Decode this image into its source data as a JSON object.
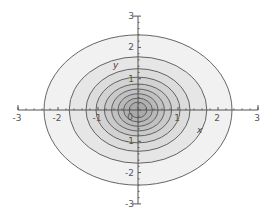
{
  "chart_data": {
    "type": "contour",
    "title": "",
    "xlabel": "x",
    "ylabel": "y",
    "xlim": [
      -3,
      3
    ],
    "ylim": [
      -3,
      3
    ],
    "x_ticks": [
      "-3",
      "-2",
      "-1",
      "0",
      "1",
      "2",
      "3"
    ],
    "y_ticks": [
      "3",
      "2",
      "1",
      "0",
      "-1",
      "-2",
      "-3"
    ],
    "grid": false,
    "legend": null,
    "center": [
      0,
      0
    ],
    "levels": [
      {
        "rx": 2.35,
        "ry": 2.4,
        "fill": "#f1f1f1"
      },
      {
        "rx": 1.72,
        "ry": 1.7,
        "fill": "#e6e6e6"
      },
      {
        "rx": 1.3,
        "ry": 1.32,
        "fill": "#dcdcdc"
      },
      {
        "rx": 1.05,
        "ry": 1.05,
        "fill": "#d2d2d2"
      },
      {
        "rx": 0.84,
        "ry": 0.83,
        "fill": "#c9c9c9"
      },
      {
        "rx": 0.66,
        "ry": 0.67,
        "fill": "#c1c1c1"
      },
      {
        "rx": 0.5,
        "ry": 0.52,
        "fill": "#b9b9b9"
      },
      {
        "rx": 0.36,
        "ry": 0.38,
        "fill": "#b1b1b1"
      },
      {
        "rx": 0.22,
        "ry": 0.25,
        "fill": "#aaaaaa"
      }
    ],
    "line_color": "#555555",
    "axis_color": "#555555"
  },
  "labels": {
    "x_axis": "x",
    "y_axis": "y"
  }
}
